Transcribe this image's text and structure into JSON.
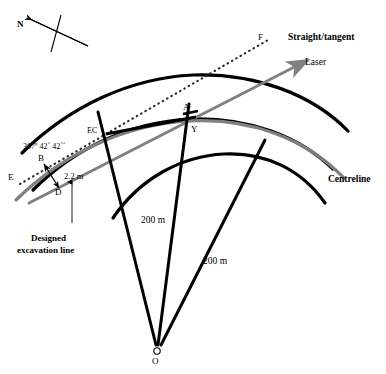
{
  "figure": {
    "type": "engineering-survey-diagram",
    "background_color": "#ffffff",
    "line_color_primary": "#000000",
    "line_color_secondary": "#808080",
    "width": 386,
    "height": 374
  },
  "labels": {
    "north": "N",
    "point_ec": "EC",
    "point_a": "A",
    "point_y": "Y",
    "point_b": "B",
    "point_d": "D",
    "point_e": "E",
    "point_f": "F",
    "point_o": "O",
    "bearing": "307º 42´ 42´´",
    "offset_distance": "2.2 m",
    "radius_inner": "200 m",
    "radius_outer": "200 m",
    "straight_tangent": "Straight/tangent",
    "laser": "Laser",
    "centreline": "Centreline",
    "designed_excavation_line_1": "Designed",
    "designed_excavation_line_2": "excavation line"
  },
  "annotations": {
    "bearing_value_degrees": 307,
    "bearing_value_minutes": 42,
    "bearing_value_seconds": 42,
    "offset_value_m": 2.2,
    "curve_radius_m": 200,
    "arc_centre_label": "O"
  },
  "colors": {
    "black": "#000000",
    "grey": "#808080",
    "dotted": "#333333",
    "white": "#ffffff"
  }
}
